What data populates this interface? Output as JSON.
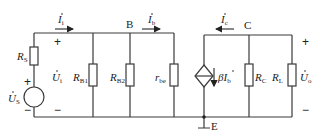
{
  "diagram": {
    "type": "small-signal equivalent circuit",
    "nodes": {
      "B": "B",
      "C": "C",
      "E": "E"
    },
    "source": {
      "name": "U",
      "sub": "S",
      "plus": "+",
      "minus": "−"
    },
    "input_voltage": {
      "name": "U",
      "sub": "i",
      "plus": "+",
      "minus": "−"
    },
    "output_voltage": {
      "name": "U",
      "sub": "o",
      "plus": "+",
      "minus": "−"
    },
    "currents": {
      "i": {
        "name": "I",
        "sub": "i"
      },
      "b": {
        "name": "I",
        "sub": "b"
      },
      "c": {
        "name": "I",
        "sub": "c"
      }
    },
    "resistors": [
      {
        "name": "R",
        "sub": "S"
      },
      {
        "name": "R",
        "sub": "B1"
      },
      {
        "name": "R",
        "sub": "B2"
      },
      {
        "name": "r",
        "sub": "be"
      },
      {
        "name": "R",
        "sub": "C"
      },
      {
        "name": "R",
        "sub": "L"
      }
    ],
    "dependent_source": {
      "prefix": "β",
      "name": "I",
      "sub": "b"
    }
  }
}
